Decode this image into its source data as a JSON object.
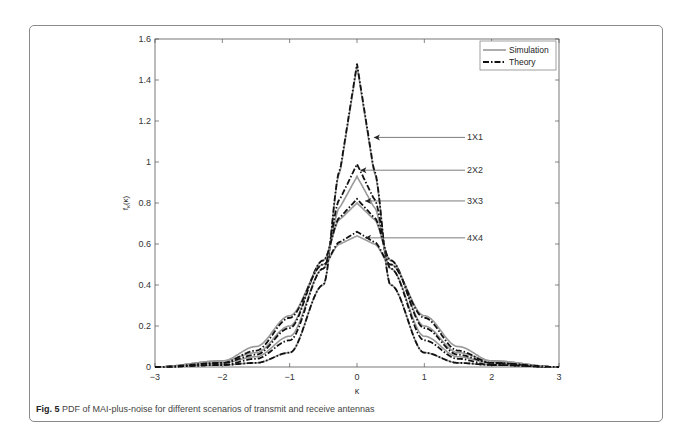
{
  "figure": {
    "label": "Fig. 5",
    "caption": "PDF of MAI-plus-noise for different scenarios of transmit and receive antennas"
  },
  "chart_data": {
    "type": "line",
    "title": "",
    "xlabel": "κ",
    "ylabel": "f_κ(κ)",
    "xlim": [
      -3,
      3
    ],
    "ylim": [
      0,
      1.6
    ],
    "xticks": [
      "-3",
      "-2",
      "-1",
      "0",
      "1",
      "2",
      "3"
    ],
    "yticks": [
      "0",
      "0.2",
      "0.4",
      "0.6",
      "0.8",
      "1",
      "1.2",
      "1.4",
      "1.6"
    ],
    "grid": false,
    "legend": {
      "position": "upper right",
      "entries": [
        "Simulation",
        "Theory"
      ]
    },
    "annotations": [
      "1X1",
      "2X2",
      "3X3",
      "4X4"
    ],
    "series": [
      {
        "name": "1X1 Simulation",
        "style": "solid-gray",
        "peak": 1.47,
        "x": [
          -3,
          -2,
          -1.5,
          -1,
          -0.5,
          -0.25,
          0,
          0.25,
          0.5,
          1,
          1.5,
          2,
          3
        ],
        "y": [
          0,
          0.01,
          0.02,
          0.07,
          0.4,
          0.95,
          1.47,
          0.95,
          0.4,
          0.07,
          0.02,
          0.01,
          0
        ]
      },
      {
        "name": "1X1 Theory",
        "style": "dash-dot-black",
        "peak": 1.48,
        "x": [
          -3,
          -2,
          -1.5,
          -1,
          -0.5,
          -0.25,
          0,
          0.25,
          0.5,
          1,
          1.5,
          2,
          3
        ],
        "y": [
          0,
          0.01,
          0.02,
          0.07,
          0.4,
          0.96,
          1.48,
          0.96,
          0.4,
          0.07,
          0.02,
          0.01,
          0
        ]
      },
      {
        "name": "2X2 Simulation",
        "style": "solid-gray",
        "peak": 0.93,
        "x": [
          -3,
          -2,
          -1.5,
          -1,
          -0.5,
          -0.25,
          0,
          0.25,
          0.5,
          1,
          1.5,
          2,
          3
        ],
        "y": [
          0,
          0.02,
          0.05,
          0.15,
          0.48,
          0.78,
          0.93,
          0.78,
          0.48,
          0.15,
          0.05,
          0.02,
          0
        ]
      },
      {
        "name": "2X2 Theory",
        "style": "dash-dot-black",
        "peak": 0.99,
        "x": [
          -3,
          -2,
          -1.5,
          -1,
          -0.5,
          -0.25,
          0,
          0.25,
          0.5,
          1,
          1.5,
          2,
          3
        ],
        "y": [
          0,
          0.01,
          0.04,
          0.13,
          0.48,
          0.82,
          0.99,
          0.82,
          0.48,
          0.13,
          0.04,
          0.01,
          0
        ]
      },
      {
        "name": "3X3 Simulation",
        "style": "solid-gray",
        "peak": 0.8,
        "x": [
          -3,
          -2,
          -1.5,
          -1,
          -0.5,
          -0.25,
          0,
          0.25,
          0.5,
          1,
          1.5,
          2,
          3
        ],
        "y": [
          0,
          0.03,
          0.07,
          0.2,
          0.52,
          0.72,
          0.8,
          0.72,
          0.52,
          0.2,
          0.07,
          0.03,
          0
        ]
      },
      {
        "name": "3X3 Theory",
        "style": "dash-dot-black",
        "peak": 0.82,
        "x": [
          -3,
          -2,
          -1.5,
          -1,
          -0.5,
          -0.25,
          0,
          0.25,
          0.5,
          1,
          1.5,
          2,
          3
        ],
        "y": [
          0,
          0.02,
          0.06,
          0.19,
          0.52,
          0.73,
          0.82,
          0.73,
          0.52,
          0.19,
          0.06,
          0.02,
          0
        ]
      },
      {
        "name": "4X4 Simulation",
        "style": "solid-gray",
        "peak": 0.64,
        "x": [
          -3,
          -2,
          -1.5,
          -1,
          -0.5,
          -0.25,
          0,
          0.25,
          0.5,
          1,
          1.5,
          2,
          3
        ],
        "y": [
          0,
          0.03,
          0.1,
          0.25,
          0.5,
          0.6,
          0.64,
          0.6,
          0.5,
          0.25,
          0.1,
          0.03,
          0
        ]
      },
      {
        "name": "4X4 Theory",
        "style": "dash-dot-black",
        "peak": 0.66,
        "x": [
          -3,
          -2,
          -1.5,
          -1,
          -0.5,
          -0.25,
          0,
          0.25,
          0.5,
          1,
          1.5,
          2,
          3
        ],
        "y": [
          0,
          0.02,
          0.08,
          0.24,
          0.5,
          0.61,
          0.66,
          0.61,
          0.5,
          0.24,
          0.08,
          0.02,
          0
        ]
      }
    ]
  }
}
